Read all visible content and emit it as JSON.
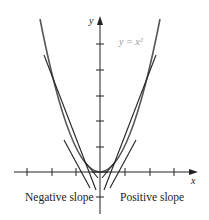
{
  "diagram": {
    "curve_label": "y = x²",
    "x_axis_label": "x",
    "y_axis_label": "y",
    "left_label": "Negative slope",
    "right_label": "Positive slope",
    "colors": {
      "curve": "#555555",
      "tangents": "#222222",
      "axes": "#222222",
      "equation": "#9a9a9a"
    }
  }
}
